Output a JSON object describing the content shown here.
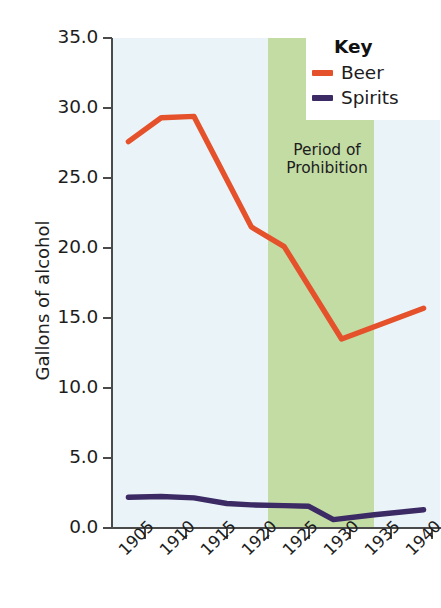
{
  "chart_data": {
    "type": "line",
    "title": "",
    "xlabel": "",
    "ylabel": "Gallons of alcohol",
    "xlim": [
      1901,
      1941
    ],
    "ylim": [
      0.0,
      35.0
    ],
    "grid": false,
    "legend_position": "top-right",
    "legend_title": "Key",
    "x_ticks": [
      "1905",
      "1910",
      "1915",
      "1920",
      "1925",
      "1930",
      "1935",
      "1940"
    ],
    "x_tick_values": [
      1905,
      1910,
      1915,
      1920,
      1925,
      1930,
      1935,
      1940
    ],
    "y_ticks": [
      "0.0",
      "5.0",
      "10.0",
      "15.0",
      "20.0",
      "25.0",
      "30.0",
      "35.0"
    ],
    "y_tick_values": [
      0.0,
      5.0,
      10.0,
      15.0,
      20.0,
      25.0,
      30.0,
      35.0
    ],
    "series": [
      {
        "name": "Beer",
        "color": "#e4512b",
        "x": [
          1903,
          1907,
          1911,
          1918,
          1922,
          1929,
          1939
        ],
        "values": [
          27.6,
          29.3,
          29.4,
          21.5,
          20.1,
          13.5,
          15.7
        ]
      },
      {
        "name": "Spirits",
        "color": "#3b2a63",
        "x": [
          1903,
          1907,
          1911,
          1915,
          1918,
          1922,
          1925,
          1928,
          1933,
          1939
        ],
        "values": [
          2.2,
          2.25,
          2.15,
          1.75,
          1.65,
          1.6,
          1.55,
          0.6,
          0.95,
          1.3
        ]
      }
    ],
    "annotations": [
      {
        "name": "prohibition-band",
        "label_lines": [
          "Period of",
          "Prohibition"
        ],
        "x_start": 1920,
        "x_end": 1933,
        "color": "#c3dca4"
      }
    ],
    "plot_background": "#eaf4f8",
    "axis_color": "#4a4a4a"
  },
  "legend": {
    "title": "Key",
    "entries": [
      {
        "label": "Beer",
        "color": "#e4512b"
      },
      {
        "label": "Spirits",
        "color": "#3b2a63"
      }
    ]
  },
  "annotation": {
    "line1": "Period of",
    "line2": "Prohibition"
  },
  "axes": {
    "y_title": "Gallons of alcohol"
  }
}
